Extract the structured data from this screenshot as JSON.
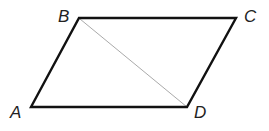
{
  "diagram": {
    "type": "parallelogram",
    "vertices": {
      "A": {
        "label": "A",
        "x": 31,
        "y": 107
      },
      "B": {
        "label": "B",
        "x": 79,
        "y": 18
      },
      "C": {
        "label": "C",
        "x": 236,
        "y": 18
      },
      "D": {
        "label": "D",
        "x": 187,
        "y": 107
      }
    },
    "edges": [
      "AB",
      "BC",
      "CD",
      "DA"
    ],
    "diagonals": [
      "BD"
    ],
    "colors": {
      "edge": "#111111",
      "diagonal": "#aaaaaa",
      "label": "#222222"
    }
  }
}
